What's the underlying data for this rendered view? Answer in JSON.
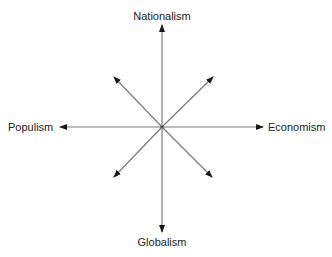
{
  "diagram": {
    "type": "compass-axes",
    "center": [
      162,
      127
    ],
    "colors": {
      "line": "#7a7a7a",
      "arrowhead": "#1a1a1a",
      "text": "#222222",
      "background": "#ffffff"
    },
    "labels": {
      "top": "Nationalism",
      "bottom": "Globalism",
      "left": "Populism",
      "right": "Economism"
    },
    "arrows": [
      {
        "direction": "up",
        "to": [
          162,
          25
        ]
      },
      {
        "direction": "down",
        "to": [
          162,
          232
        ]
      },
      {
        "direction": "left",
        "to": [
          60,
          127
        ]
      },
      {
        "direction": "right",
        "to": [
          263,
          127
        ]
      },
      {
        "direction": "up-left",
        "to": [
          114,
          77
        ]
      },
      {
        "direction": "up-right",
        "to": [
          213,
          77
        ]
      },
      {
        "direction": "down-left",
        "to": [
          114,
          177
        ]
      },
      {
        "direction": "down-right",
        "to": [
          212,
          177
        ]
      }
    ]
  }
}
